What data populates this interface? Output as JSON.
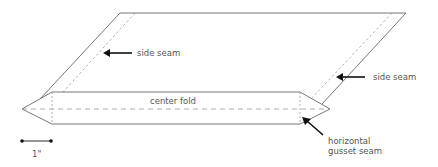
{
  "diagram": {
    "labels": {
      "side_seam_left": "side seam",
      "side_seam_right": "side seam",
      "center_fold": "center fold",
      "gusset_seam_line1": "horizontal",
      "gusset_seam_line2": "gusset seam",
      "scale": "1\""
    },
    "colors": {
      "outline": "#666666",
      "dashed": "#999999",
      "arrow": "#111111",
      "text": "#555555"
    }
  }
}
